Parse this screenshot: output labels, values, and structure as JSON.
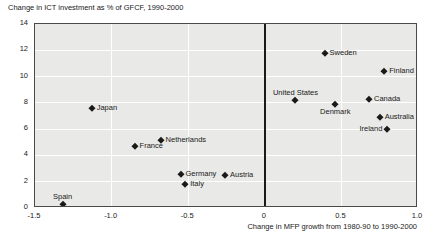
{
  "chart_data": {
    "type": "scatter",
    "title": "Change in ICT investment as % of GFCF, 1990-2000",
    "xlabel": "Change in MFP growth from 1980-90 to 1990-2000",
    "ylabel": "Change in ICT investment as % of GFCF, 1990-2000",
    "xlim": [
      -1.5,
      1.0
    ],
    "ylim": [
      0,
      14
    ],
    "x_ticks": [
      {
        "value": -1.5,
        "label": "-1.5"
      },
      {
        "value": -1.0,
        "label": "-1.0"
      },
      {
        "value": -0.5,
        "label": "-0.5"
      },
      {
        "value": 0,
        "label": "0"
      },
      {
        "value": 0.5,
        "label": "0.5"
      },
      {
        "value": 1.0,
        "label": "1.0"
      }
    ],
    "y_ticks": [
      {
        "value": 0,
        "label": "0"
      },
      {
        "value": 2,
        "label": "2"
      },
      {
        "value": 4,
        "label": "4"
      },
      {
        "value": 6,
        "label": "6"
      },
      {
        "value": 8,
        "label": "8"
      },
      {
        "value": 10,
        "label": "10"
      },
      {
        "value": 12,
        "label": "12"
      },
      {
        "value": 14,
        "label": "14"
      }
    ],
    "grid": true,
    "zero_reference_line_x": 0,
    "legend": "none",
    "points": [
      {
        "label": "Spain",
        "x": -1.32,
        "y": 0.3,
        "label_pos": "above"
      },
      {
        "label": "Japan",
        "x": -1.13,
        "y": 7.6,
        "label_pos": "right"
      },
      {
        "label": "France",
        "x": -0.85,
        "y": 4.7,
        "label_pos": "right"
      },
      {
        "label": "Netherlands",
        "x": -0.68,
        "y": 5.2,
        "label_pos": "right"
      },
      {
        "label": "Germany",
        "x": -0.55,
        "y": 2.6,
        "label_pos": "right"
      },
      {
        "label": "Italy",
        "x": -0.52,
        "y": 1.8,
        "label_pos": "right"
      },
      {
        "label": "Austria",
        "x": -0.26,
        "y": 2.5,
        "label_pos": "right"
      },
      {
        "label": "United States",
        "x": 0.2,
        "y": 8.2,
        "label_pos": "above"
      },
      {
        "label": "Sweden",
        "x": 0.39,
        "y": 11.8,
        "label_pos": "right"
      },
      {
        "label": "Denmark",
        "x": 0.46,
        "y": 7.9,
        "label_pos": "below"
      },
      {
        "label": "Canada",
        "x": 0.68,
        "y": 8.3,
        "label_pos": "right"
      },
      {
        "label": "Australia",
        "x": 0.75,
        "y": 6.9,
        "label_pos": "right"
      },
      {
        "label": "Finland",
        "x": 0.78,
        "y": 10.4,
        "label_pos": "right"
      },
      {
        "label": "Ireland",
        "x": 0.8,
        "y": 6.0,
        "label_pos": "left"
      }
    ],
    "colors": {
      "marker": "#1a1a1a",
      "plot_background": "#e9e9e7",
      "gridline": "#ffffff",
      "border": "#4a4a4a",
      "text": "#1a1a1a"
    }
  }
}
